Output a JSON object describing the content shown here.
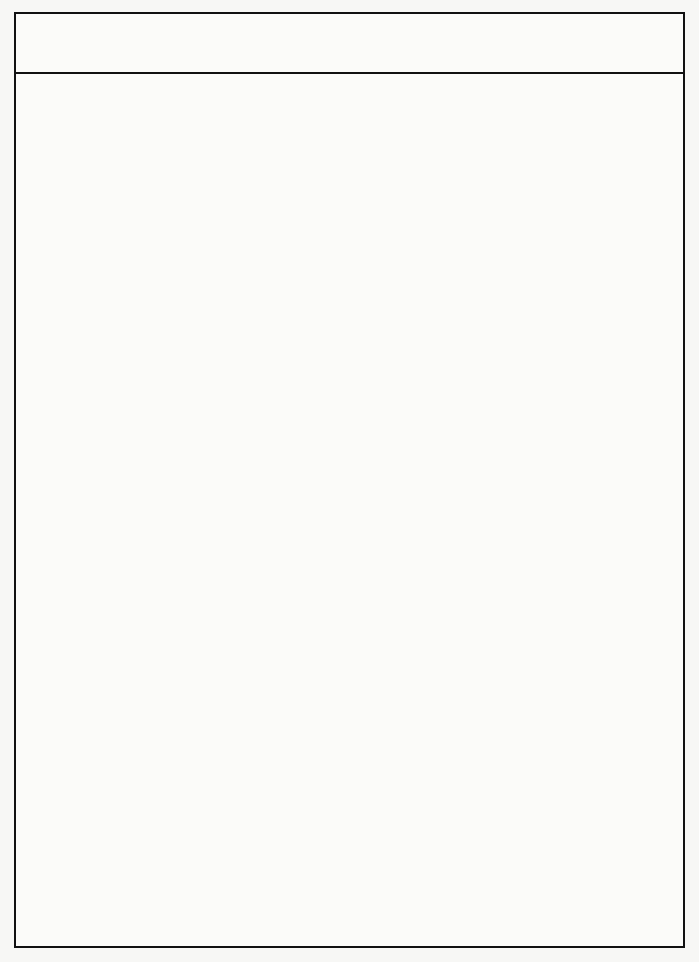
{
  "chart_data": {
    "type": "bar",
    "orientation": "horizontal",
    "subtype": "range-bar",
    "xlabel": "Mikrohärte [HV0.05]",
    "ylabel": "",
    "xlim": [
      0,
      4400
    ],
    "xticks": [
      0,
      1000,
      2000,
      3000,
      4000
    ],
    "xticklabels": [
      "0",
      "1000",
      "2000",
      "3000",
      "4000"
    ],
    "grid": "vertical",
    "legend": "none",
    "bar_color": "#0a0a0a",
    "groups": [
      {
        "group_label": "Hartphasen",
        "group_label_lines": [
          "Hartphasen"
        ],
        "rows": [
          {
            "name": "MB<sub>2</sub>",
            "name_plain": "MB2",
            "alloy": "Ti",
            "min": 3200,
            "max": 3830
          },
          {
            "name": "MB<sub>2</sub>",
            "name_plain": "MB2",
            "alloy": "Cr",
            "min": 2420,
            "max": 2720
          },
          {
            "name": "MC",
            "name_plain": "MC",
            "alloy": "Nb,V,Ti",
            "min": 2200,
            "max": 3220
          },
          {
            "name": "MC/M<sub>2</sub>C",
            "name_plain": "MC/M2C",
            "alloy": "W",
            "min": 2500,
            "max": 3000
          },
          {
            "name": "M<sub>2</sub>C",
            "name_plain": "M2C",
            "alloy": "Fe, Mo",
            "min": 1445,
            "max": 1820
          },
          {
            "name": "M<sub>3</sub>B<sub>2</sub>",
            "name_plain": "M3B2",
            "alloy": "Mo",
            "min": 2200,
            "max": 3000
          },
          {
            "name": "M<sub>3</sub>B<sub>2</sub>",
            "name_plain": "M3B2",
            "alloy": "Cr",
            "min": 2000,
            "max": 2610
          },
          {
            "name": "MB",
            "name_plain": "MB",
            "alloy": "Cr",
            "min": 1800,
            "max": 2410
          },
          {
            "name": "M<sub>2</sub>B",
            "name_plain": "M2B",
            "alloy": "Cr",
            "min": 1600,
            "max": 1905
          },
          {
            "name": "M<sub>6</sub>C",
            "name_plain": "M6C",
            "alloy": "Fe,W, Mo",
            "min": 1255,
            "max": 1645
          },
          {
            "name": "M<sub>7</sub>C<sub>3</sub>",
            "name_plain": "M7C3",
            "alloy": "Cr",
            "min": 1185,
            "max": 1590
          },
          {
            "name": "M<sub>23</sub>C<sub>6</sub>",
            "name_plain": "M23C6",
            "alloy": "Cr",
            "min": 950,
            "max": 1420
          },
          {
            "name": "MN, M<sub>2</sub>N",
            "name_plain": "MN, M2N",
            "alloy": "Cr",
            "min": 1605,
            "max": 1795
          },
          {
            "name": "M<sub>3</sub>B",
            "name_plain": "M3B",
            "alloy": "Fe",
            "min": 955,
            "max": 1605
          },
          {
            "name": "M<sub>2</sub>B",
            "name_plain": "M2B",
            "alloy": "Fe",
            "min": 990,
            "max": 1480
          },
          {
            "name": "M<sub>3</sub>C",
            "name_plain": "M3C",
            "alloy": "Fe",
            "min": 775,
            "max": 1135
          },
          {
            "name": "M<sub>3</sub>B",
            "name_plain": "M3B",
            "alloy": "Ni",
            "min": 740,
            "max": 1135
          },
          {
            "name": "M<sub>3</sub>P",
            "name_plain": "M3P",
            "alloy": "Fe",
            "min": 835,
            "max": 1070
          }
        ]
      },
      {
        "group_label": "Metall-matrizes",
        "group_label_lines": [
          "Metall-",
          "matrizes"
        ],
        "rows": [
          {
            "name": "Martensit",
            "name_plain": "Martensit",
            "alloy": "",
            "min": 500,
            "max": 1000
          },
          {
            "name": "Ferrit",
            "name_plain": "Ferrit",
            "alloy": "",
            "min": 170,
            "max": 395
          },
          {
            "name": "Austenit",
            "name_plain": "Austenit",
            "alloy": "",
            "min": 385,
            "max": 600
          }
        ]
      },
      {
        "group_label": "abrasive Teilchen",
        "group_label_lines": [
          "abrasive",
          "Teilchen"
        ],
        "rows": [
          {
            "name": "Kalzit",
            "name_plain": "Kalzit",
            "alloy": "",
            "min": 185,
            "max": 495
          },
          {
            "name": "Glas, Flint",
            "name_plain": "Glas, Flint",
            "alloy": "",
            "min": 530,
            "max": 1205
          },
          {
            "name": "Quarz",
            "name_plain": "Quarz",
            "alloy": "",
            "min": 1035,
            "max": 1265
          },
          {
            "name": "Granat",
            "name_plain": "Granat",
            "alloy": "",
            "min": 1335,
            "max": 1550
          },
          {
            "name": "Al<sub>2</sub>O<sub>3</sub>",
            "name_plain": "Al2O3",
            "alloy": "",
            "min": 1995,
            "max": 2145
          },
          {
            "name": "SiC",
            "name_plain": "SiC",
            "alloy": "",
            "min": 2620,
            "max": 3160
          },
          {
            "name": "BN",
            "name_plain": "BN",
            "alloy": "",
            "min": 4130,
            "max": 4370
          }
        ]
      },
      {
        "group_label": "Schneid-stoffe",
        "group_label_lines": [
          "Schneid-",
          "stoffe"
        ],
        "rows": [
          {
            "name": "HSS",
            "name_plain": "HSS",
            "alloy": "",
            "min": 545,
            "max": 930
          },
          {
            "name": "Hartmetall",
            "name_plain": "Hartmetall",
            "alloy": "",
            "min": 1140,
            "max": 1815
          },
          {
            "name": "Schneidkeramik",
            "name_plain": "Schneidkeramik",
            "alloy": "",
            "min": 1470,
            "max": 2120
          },
          {
            "name": "Si<sub>3</sub>N<sub>4</sub>-Keramik",
            "name_plain": "Si3N4-Keramik",
            "alloy": "",
            "min": 1190,
            "max": 1620
          },
          {
            "name": "PKB",
            "name_plain": "PKB",
            "alloy": "",
            "min": 3480,
            "max": 4370
          },
          {
            "name": "PKD",
            "name_plain": "PKD",
            "alloy": "",
            "min": null,
            "max": null
          }
        ]
      }
    ]
  }
}
